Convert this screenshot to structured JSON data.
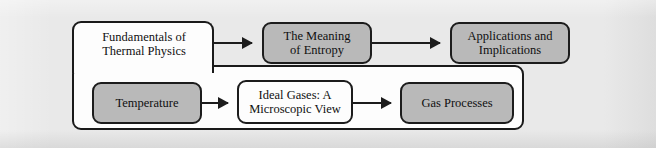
{
  "figure": {
    "type": "flowchart",
    "background_color": "#e9e9e9",
    "border_color": "#1c1c1c",
    "shaded_node_color": "#b9b9b9",
    "plain_node_color": "#fdfdfd"
  },
  "enclosure": {
    "label": "Fundamentals of Thermal Physics enclosure"
  },
  "nodes": [
    {
      "id": "fundamentals",
      "label": "Fundamentals of\nThermal Physics",
      "line1": "Fundamentals of",
      "line2": "Thermal Physics",
      "style": "plain",
      "row": "top"
    },
    {
      "id": "entropy",
      "label": "The Meaning of Entropy",
      "line1": "The Meaning",
      "line2": "of Entropy",
      "style": "shaded",
      "row": "top"
    },
    {
      "id": "applications",
      "label": "Applications and Implications",
      "line1": "Applications and",
      "line2": "Implications",
      "style": "shaded",
      "row": "top"
    },
    {
      "id": "temperature",
      "label": "Temperature",
      "line1": "Temperature",
      "line2": "",
      "style": "shaded",
      "row": "bottom"
    },
    {
      "id": "ideal_gases",
      "label": "Ideal Gases: A Microscopic View",
      "line1": "Ideal Gases: A",
      "line2": "Microscopic View",
      "style": "plain",
      "row": "bottom"
    },
    {
      "id": "gas_processes",
      "label": "Gas Processes",
      "line1": "Gas Processes",
      "line2": "",
      "style": "shaded",
      "row": "bottom"
    }
  ],
  "edges": [
    {
      "id": "e1",
      "from": "fundamentals",
      "to": "entropy",
      "glyph": "arrow-right"
    },
    {
      "id": "e2",
      "from": "entropy",
      "to": "applications",
      "glyph": "arrow-right"
    },
    {
      "id": "e3",
      "from": "temperature",
      "to": "ideal_gases",
      "glyph": "arrow-right"
    },
    {
      "id": "e4",
      "from": "ideal_gases",
      "to": "gas_processes",
      "glyph": "arrow-right"
    }
  ]
}
